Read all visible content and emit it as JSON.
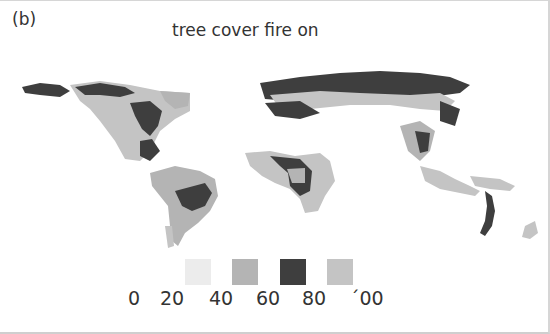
{
  "figure": {
    "panel_label": "(b)",
    "title": "tree cover fire on"
  },
  "legend": {
    "ticks": [
      "0",
      "20",
      "40",
      "60",
      "80",
      "´00"
    ],
    "classes": [
      {
        "range": "20-40",
        "color": "#ececec"
      },
      {
        "range": "40-60",
        "color": "#b4b4b4"
      },
      {
        "range": "60-80",
        "color": "#3e3e3e"
      },
      {
        "range": "80-100",
        "color": "#c4c4c4"
      }
    ]
  },
  "map": {
    "type": "world tree cover map (grayscale)",
    "colors": {
      "background": "#ffffff",
      "low": "#ececec",
      "mid": "#b4b4b4",
      "high": "#3e3e3e",
      "max": "#c4c4c4"
    }
  }
}
